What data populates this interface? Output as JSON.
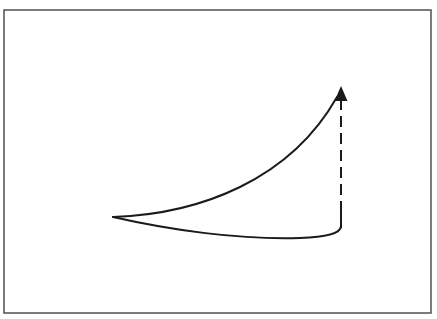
{
  "diagram": {
    "title": "",
    "labels": [],
    "elements": [
      {
        "id": "frame",
        "kind": "border-rectangle"
      },
      {
        "id": "upper-curve",
        "kind": "solid-curve",
        "from": "left-apex",
        "to": "arrow-tip",
        "shape": "concave-up rising"
      },
      {
        "id": "lower-curve",
        "kind": "solid-curve",
        "from": "left-apex",
        "to": "bottom-right-corner",
        "shape": "shallow sag"
      },
      {
        "id": "vertical-connector",
        "kind": "dashed-line",
        "from": "bottom-right-corner",
        "to": "arrow-tip",
        "direction": "up"
      },
      {
        "id": "arrowhead",
        "kind": "arrowhead",
        "direction": "up"
      }
    ],
    "colors": {
      "stroke": "#1a1a1a",
      "frame": "#5a5a5a",
      "background": "#ffffff"
    }
  }
}
